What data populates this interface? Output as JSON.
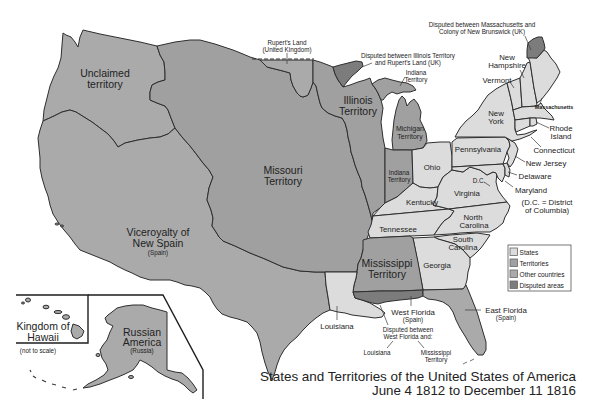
{
  "title": {
    "line1": "States and Territories of the United States of America",
    "line2": "June 4 1812 to December 11 1816"
  },
  "colors": {
    "states": "#dcdcdc",
    "territories": "#a0a0a0",
    "other_countries": "#aaaaaa",
    "disputed": "#7c7c7c",
    "border": "#2e2e2e",
    "text": "#222222",
    "background": "#ffffff"
  },
  "legend": {
    "items": [
      {
        "label": "States",
        "category": "states"
      },
      {
        "label": "Territories",
        "category": "territories"
      },
      {
        "label": "Other countries",
        "category": "other_countries"
      },
      {
        "label": "Disputed areas",
        "category": "disputed"
      }
    ]
  },
  "map": {
    "labels": {
      "unclaimed": [
        "Unclaimed",
        "territory"
      ],
      "viceroyalty": [
        "Viceroyalty of",
        "New Spain",
        "(Spain)"
      ],
      "missouri": [
        "Missouri",
        "Territory"
      ],
      "illinois": [
        "Illinois",
        "Territory"
      ],
      "michigan": [
        "Michigan",
        "Territory"
      ],
      "indiana": [
        "Indiana",
        "Territory"
      ],
      "mississippi": [
        "Mississippi",
        "Territory"
      ],
      "ohio": "Ohio",
      "pennsylvania": "Pennsylvania",
      "new_york": [
        "New",
        "York"
      ],
      "vermont": "Vermont",
      "new_hampshire": [
        "New",
        "Hampshire"
      ],
      "massachusetts": "Massachusetts",
      "rhode_island": [
        "Rhode",
        "Island"
      ],
      "connecticut": "Connecticut",
      "new_jersey": "New Jersey",
      "delaware": "Delaware",
      "maryland": "Maryland",
      "dc": "D.C.",
      "dc_note": [
        "(D.C. = District",
        "of Columbia)"
      ],
      "virginia": "Virginia",
      "kentucky": "Kentucky",
      "tennessee": "Tennessee",
      "north_carolina": [
        "North",
        "Carolina"
      ],
      "south_carolina": [
        "South",
        "Carolina"
      ],
      "georgia": "Georgia",
      "louisiana": "Louisiana",
      "west_florida": [
        "West Florida",
        "(Spain)"
      ],
      "east_florida": [
        "East Florida",
        "(Spain)"
      ]
    },
    "annotations": {
      "ruperts_land": [
        "Rupert's Land",
        "(United Kingdom)"
      ],
      "disputed_illinois": [
        "Disputed between Illinois Territory",
        "and Rupert's Land (UK)"
      ],
      "indiana_territory_pointer": [
        "Indiana",
        "Territory"
      ],
      "disputed_maine": [
        "Disputed between Massachusetts and",
        "Colony of New Brunswick (UK)"
      ],
      "disputed_west_florida": [
        "Disputed between",
        "West Florida and:"
      ],
      "disputed_wf_louisiana": "Louisiana",
      "disputed_wf_mississippi": [
        "Mississippi",
        "Territory"
      ]
    }
  },
  "insets": {
    "hawaii": {
      "label": [
        "Kingdom of",
        "Hawaii"
      ],
      "note": "(not to scale)"
    },
    "alaska": {
      "label": [
        "Russian",
        "America"
      ],
      "sub": "(Russia)"
    }
  }
}
